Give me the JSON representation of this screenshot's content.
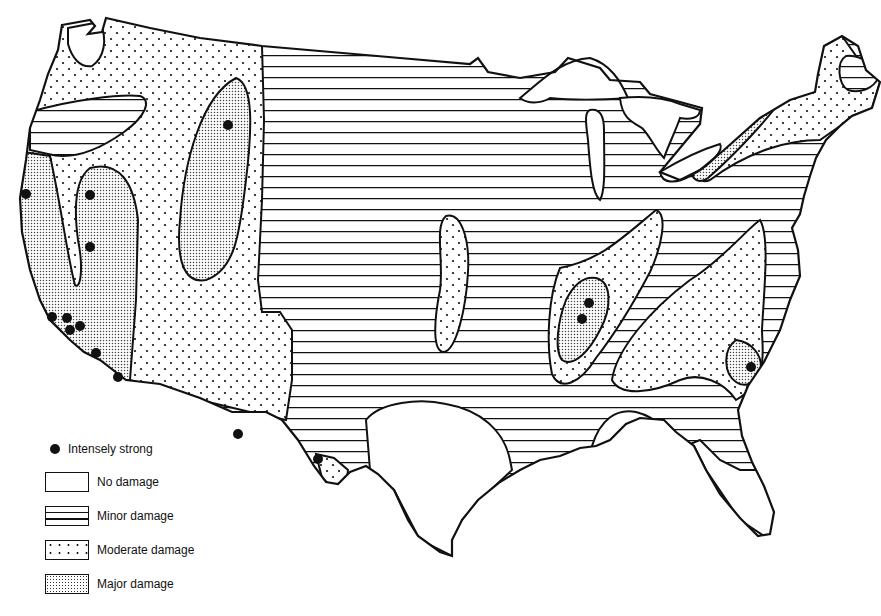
{
  "map": {
    "subject": "United States damage intensity zones",
    "colors": {
      "ink": "#111111",
      "background": "#ffffff"
    },
    "zones": [
      {
        "name": "Pacific Northwest / West",
        "category": "Moderate damage"
      },
      {
        "name": "Oregon band",
        "category": "Minor damage"
      },
      {
        "name": "Western Washington pocket",
        "category": "No damage"
      },
      {
        "name": "California coast",
        "category": "Major damage"
      },
      {
        "name": "Nevada / Idaho belt",
        "category": "Major damage"
      },
      {
        "name": "Central plains",
        "category": "Minor damage"
      },
      {
        "name": "Kansas/Nebraska strip",
        "category": "Moderate damage"
      },
      {
        "name": "New Madrid region",
        "category": "Moderate damage"
      },
      {
        "name": "New Madrid core",
        "category": "Major damage"
      },
      {
        "name": "Southern Appalachians",
        "category": "Moderate damage"
      },
      {
        "name": "Charleston",
        "category": "Major damage"
      },
      {
        "name": "Northeast / St. Lawrence",
        "category": "Moderate damage"
      },
      {
        "name": "St. Lawrence valley",
        "category": "Major damage"
      },
      {
        "name": "Maine interior",
        "category": "Minor damage"
      },
      {
        "name": "Texas / Gulf Coast / Florida",
        "category": "No damage"
      },
      {
        "name": "Great Lakes (water)",
        "category": "No damage"
      },
      {
        "name": "West Texas tip",
        "category": "Moderate damage"
      }
    ],
    "intense_points_count": 14
  },
  "legend": {
    "items": [
      {
        "symbol": "dot",
        "label": "Intensely strong"
      },
      {
        "symbol": "blank",
        "label": "No damage"
      },
      {
        "symbol": "horizontal-lines",
        "label": "Minor damage"
      },
      {
        "symbol": "sparse-dots",
        "label": "Moderate damage"
      },
      {
        "symbol": "dense-dots",
        "label": "Major damage"
      }
    ]
  }
}
